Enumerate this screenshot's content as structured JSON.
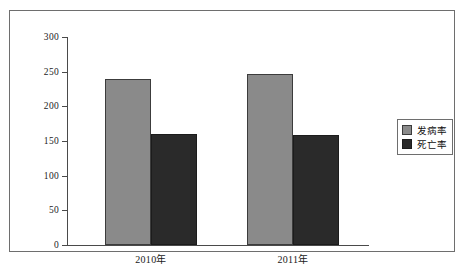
{
  "chart_data": {
    "type": "bar",
    "title": "",
    "subtitle": "",
    "xlabel": "",
    "ylabel": "",
    "categories": [
      "2010年",
      "2011年"
    ],
    "series": [
      {
        "name": "发病率",
        "values": [
          240,
          247
        ],
        "color": "#8a8a8a"
      },
      {
        "name": "死亡率",
        "values": [
          160,
          158
        ],
        "color": "#2a2a2a"
      }
    ],
    "ylim": [
      0,
      300
    ],
    "ytick_values": [
      0,
      50,
      100,
      150,
      200,
      250,
      300
    ],
    "ytick_labels": [
      "0",
      "50",
      "100",
      "150",
      "200",
      "250",
      "300"
    ],
    "grid": false,
    "legend_position": "right",
    "legend_entries": [
      "发病率",
      "死亡率"
    ],
    "axis_color": "#4a4a4a",
    "frame_color": "#6e6e6e",
    "background": "#ffffff"
  }
}
